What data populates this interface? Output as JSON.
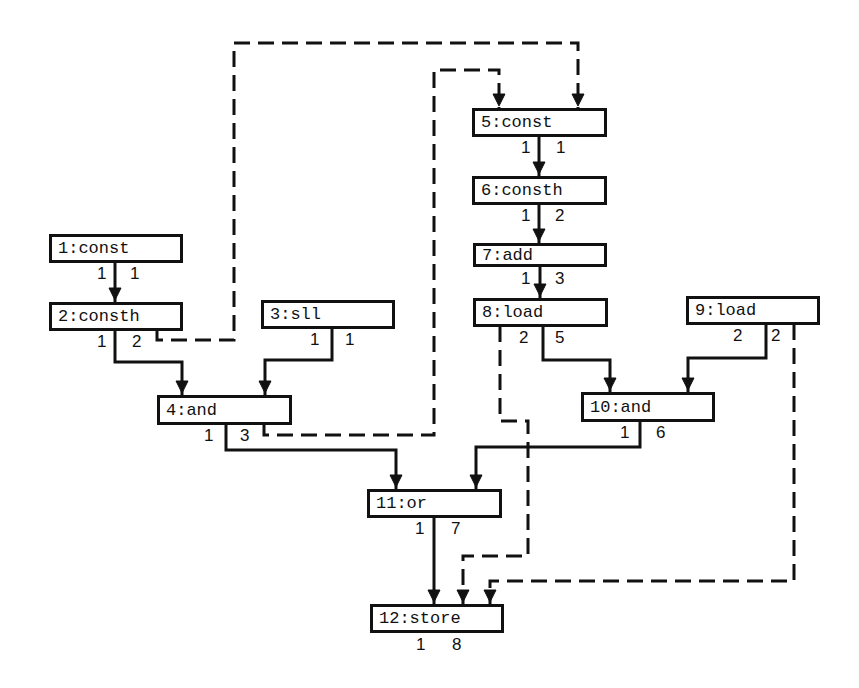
{
  "diagram": {
    "type": "dataflow-graph",
    "nodes": [
      {
        "id": 1,
        "label": "1:const",
        "out": [
          "1",
          "1"
        ]
      },
      {
        "id": 2,
        "label": "2:consth",
        "out": [
          "1",
          "2"
        ]
      },
      {
        "id": 3,
        "label": "3:sll",
        "out": [
          "1",
          "1"
        ]
      },
      {
        "id": 4,
        "label": "4:and",
        "out": [
          "1",
          "3"
        ]
      },
      {
        "id": 5,
        "label": "5:const",
        "out": [
          "1",
          "1"
        ]
      },
      {
        "id": 6,
        "label": "6:consth",
        "out": [
          "1",
          "2"
        ]
      },
      {
        "id": 7,
        "label": "7:add",
        "out": [
          "1",
          "3"
        ]
      },
      {
        "id": 8,
        "label": "8:load",
        "out": [
          "2",
          "5"
        ]
      },
      {
        "id": 9,
        "label": "9:load",
        "out": [
          "2",
          "2"
        ]
      },
      {
        "id": 10,
        "label": "10:and",
        "out": [
          "1",
          "6"
        ]
      },
      {
        "id": 11,
        "label": "11:or",
        "out": [
          "1",
          "7"
        ]
      },
      {
        "id": 12,
        "label": "12:store",
        "out": [
          "1",
          "8"
        ]
      }
    ],
    "edges": [
      {
        "from": 1,
        "to": 2,
        "style": "solid"
      },
      {
        "from": 2,
        "to": 4,
        "style": "solid"
      },
      {
        "from": 3,
        "to": 4,
        "style": "solid"
      },
      {
        "from": 2,
        "to": 5,
        "style": "dashed"
      },
      {
        "from": 4,
        "to": 5,
        "style": "dashed"
      },
      {
        "from": 5,
        "to": 6,
        "style": "solid"
      },
      {
        "from": 6,
        "to": 7,
        "style": "solid"
      },
      {
        "from": 7,
        "to": 8,
        "style": "solid"
      },
      {
        "from": 8,
        "to": 10,
        "style": "solid"
      },
      {
        "from": 9,
        "to": 10,
        "style": "solid"
      },
      {
        "from": 4,
        "to": 11,
        "style": "solid"
      },
      {
        "from": 10,
        "to": 11,
        "style": "solid"
      },
      {
        "from": 11,
        "to": 12,
        "style": "solid"
      },
      {
        "from": 8,
        "to": 12,
        "style": "dashed"
      },
      {
        "from": 9,
        "to": 12,
        "style": "dashed"
      }
    ]
  }
}
